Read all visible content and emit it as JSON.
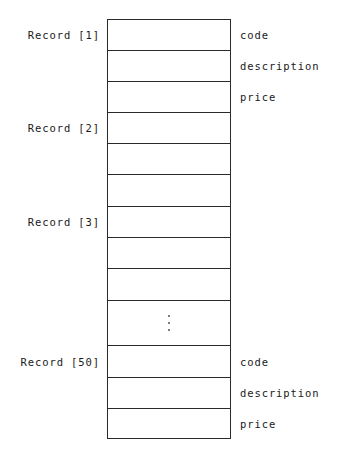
{
  "diagram": {
    "type": "array-of-records",
    "records": [
      {
        "label": "Record [1]",
        "row_start": 0,
        "show_fields": true
      },
      {
        "label": "Record [2]",
        "row_start": 3,
        "show_fields": false
      },
      {
        "label": "Record [3]",
        "row_start": 6,
        "show_fields": false
      },
      {
        "label": "Record [50]",
        "row_start": 10,
        "show_fields": true
      }
    ],
    "fields": [
      "code",
      "description",
      "price"
    ],
    "ellipsis": "⋮",
    "colors": {
      "line": "#2a2a2a",
      "text": "#1a1a1a",
      "background": "#ffffff"
    }
  },
  "labels": {
    "record_1": "Record [1]",
    "record_2": "Record [2]",
    "record_3": "Record [3]",
    "record_50": "Record [50]",
    "record_1_fields": {
      "code": "code",
      "description": "description",
      "price": "price"
    },
    "record_50_fields": {
      "code": "code",
      "description": "description",
      "price": "price"
    }
  }
}
